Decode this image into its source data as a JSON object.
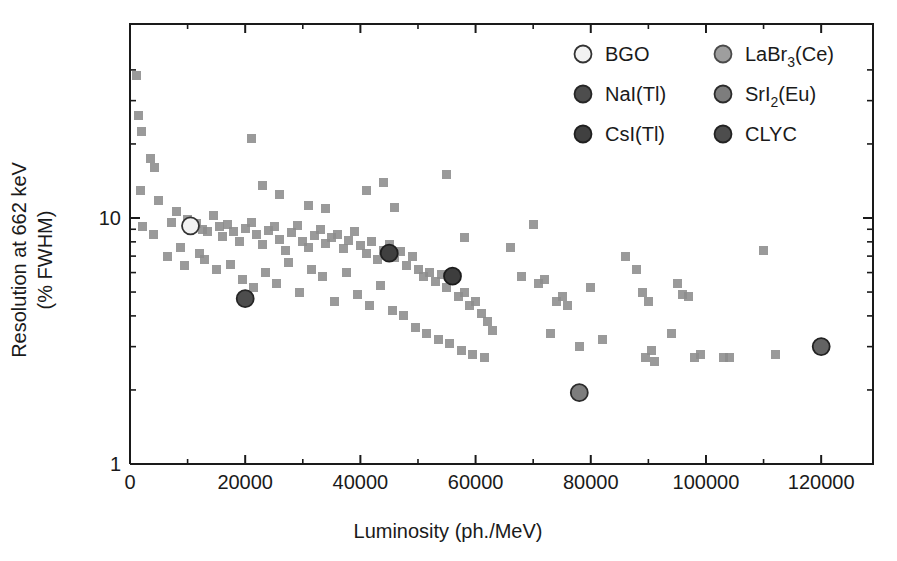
{
  "chart_data": {
    "type": "scatter",
    "title": "",
    "xlabel": "Luminosity (ph./MeV)",
    "ylabel_line1": "Resolution at 662 keV",
    "ylabel_line2": "(% FWHM)",
    "xlim": [
      0,
      129000
    ],
    "ylim": [
      1,
      45
    ],
    "yscale": "log",
    "xscale": "linear",
    "grid": false,
    "xticks": [
      0,
      20000,
      40000,
      60000,
      80000,
      100000,
      120000
    ],
    "xticklabels": [
      "0",
      "20000",
      "40000",
      "60000",
      "80000",
      "100000",
      "120000"
    ],
    "yticks": [
      1,
      10
    ],
    "yticklabels": [
      "1",
      "10"
    ],
    "legend_position": "top-right",
    "series": [
      {
        "name": "background scintillators",
        "marker": "square",
        "color": "#8c8c8c",
        "points": [
          [
            1200,
            38.0
          ],
          [
            1500,
            26.0
          ],
          [
            2000,
            22.5
          ],
          [
            1800,
            13.0
          ],
          [
            2200,
            9.2
          ],
          [
            3500,
            17.5
          ],
          [
            4200,
            16.0
          ],
          [
            5000,
            11.8
          ],
          [
            4000,
            8.6
          ],
          [
            6500,
            7.0
          ],
          [
            7200,
            9.6
          ],
          [
            8000,
            10.6
          ],
          [
            8800,
            7.6
          ],
          [
            10000,
            9.9
          ],
          [
            10500,
            9.3
          ],
          [
            11500,
            9.5
          ],
          [
            9500,
            6.4
          ],
          [
            12500,
            9.0
          ],
          [
            13500,
            8.8
          ],
          [
            12000,
            7.2
          ],
          [
            14500,
            10.2
          ],
          [
            15500,
            9.2
          ],
          [
            13000,
            6.8
          ],
          [
            16000,
            8.4
          ],
          [
            17000,
            9.4
          ],
          [
            15000,
            6.2
          ],
          [
            18000,
            8.8
          ],
          [
            19000,
            8.0
          ],
          [
            17500,
            6.5
          ],
          [
            20000,
            9.1
          ],
          [
            21000,
            9.6
          ],
          [
            19500,
            5.6
          ],
          [
            22000,
            8.6
          ],
          [
            23000,
            7.8
          ],
          [
            21500,
            5.2
          ],
          [
            24000,
            8.9
          ],
          [
            25000,
            9.2
          ],
          [
            23500,
            6.0
          ],
          [
            26000,
            8.2
          ],
          [
            27000,
            7.4
          ],
          [
            25500,
            5.4
          ],
          [
            28000,
            8.7
          ],
          [
            29000,
            9.3
          ],
          [
            27500,
            6.6
          ],
          [
            30000,
            8.0
          ],
          [
            31000,
            7.6
          ],
          [
            29500,
            5.0
          ],
          [
            32000,
            8.5
          ],
          [
            33000,
            9.0
          ],
          [
            31500,
            6.2
          ],
          [
            34000,
            7.9
          ],
          [
            35000,
            8.3
          ],
          [
            33500,
            5.8
          ],
          [
            36000,
            8.6
          ],
          [
            37000,
            7.5
          ],
          [
            35500,
            4.6
          ],
          [
            38000,
            8.1
          ],
          [
            39000,
            8.8
          ],
          [
            37500,
            6.0
          ],
          [
            40000,
            7.7
          ],
          [
            41000,
            7.2
          ],
          [
            39500,
            4.9
          ],
          [
            42000,
            8.0
          ],
          [
            43000,
            6.8
          ],
          [
            41500,
            4.4
          ],
          [
            44000,
            7.4
          ],
          [
            45000,
            7.8
          ],
          [
            43500,
            5.3
          ],
          [
            46000,
            6.9
          ],
          [
            47000,
            7.3
          ],
          [
            45500,
            4.2
          ],
          [
            48000,
            6.4
          ],
          [
            49000,
            7.0
          ],
          [
            47500,
            4.0
          ],
          [
            50000,
            6.2
          ],
          [
            51000,
            5.8
          ],
          [
            49500,
            3.6
          ],
          [
            52000,
            6.0
          ],
          [
            53000,
            5.5
          ],
          [
            51500,
            3.4
          ],
          [
            54000,
            5.9
          ],
          [
            55000,
            5.2
          ],
          [
            53500,
            3.2
          ],
          [
            56000,
            5.6
          ],
          [
            57000,
            4.8
          ],
          [
            55500,
            3.1
          ],
          [
            58000,
            5.0
          ],
          [
            59000,
            4.4
          ],
          [
            57500,
            2.9
          ],
          [
            60000,
            4.6
          ],
          [
            61000,
            4.1
          ],
          [
            59500,
            2.8
          ],
          [
            62000,
            3.8
          ],
          [
            63000,
            3.5
          ],
          [
            61500,
            2.7
          ],
          [
            21000,
            21.0
          ],
          [
            23000,
            13.5
          ],
          [
            26000,
            12.5
          ],
          [
            31000,
            11.2
          ],
          [
            34000,
            10.9
          ],
          [
            41000,
            13.0
          ],
          [
            44000,
            14.0
          ],
          [
            46000,
            11.0
          ],
          [
            55000,
            15.0
          ],
          [
            58000,
            8.3
          ],
          [
            66000,
            7.6
          ],
          [
            70000,
            9.4
          ],
          [
            68000,
            5.8
          ],
          [
            71000,
            5.4
          ],
          [
            72000,
            5.6
          ],
          [
            74000,
            4.6
          ],
          [
            75000,
            4.8
          ],
          [
            73000,
            3.4
          ],
          [
            76000,
            4.4
          ],
          [
            78000,
            3.0
          ],
          [
            80000,
            5.2
          ],
          [
            82000,
            3.2
          ],
          [
            86000,
            7.0
          ],
          [
            88000,
            6.2
          ],
          [
            89000,
            5.0
          ],
          [
            90000,
            4.6
          ],
          [
            90500,
            2.9
          ],
          [
            89500,
            2.7
          ],
          [
            91000,
            2.6
          ],
          [
            95000,
            5.4
          ],
          [
            96000,
            4.9
          ],
          [
            97000,
            4.8
          ],
          [
            94000,
            3.4
          ],
          [
            98000,
            2.7
          ],
          [
            99000,
            2.8
          ],
          [
            103000,
            2.7
          ],
          [
            104000,
            2.7
          ],
          [
            110000,
            7.4
          ],
          [
            112000,
            2.8
          ]
        ]
      }
    ],
    "highlighted": [
      {
        "label": "BGO",
        "x": 10500,
        "y": 9.3,
        "fill": "#f2f2f2",
        "stroke": "#333333"
      },
      {
        "label": "NaI(Tl)",
        "x": 20000,
        "y": 4.7,
        "fill": "#4d4d4d",
        "stroke": "#262626"
      },
      {
        "label": "CsI(Tl)",
        "x": 45000,
        "y": 7.2,
        "fill": "#404040",
        "stroke": "#1f1f1f"
      },
      {
        "label": "LaBr3(Ce)",
        "x": 56000,
        "y": 5.8,
        "fill": "#3d3d3d",
        "stroke": "#1c1c1c"
      },
      {
        "label": "SrI2(Eu)",
        "x": 78000,
        "y": 1.95,
        "fill": "#7d7d7d",
        "stroke": "#2b2b2b"
      },
      {
        "label": "CLYC",
        "x": 120000,
        "y": 3.0,
        "fill": "#636363",
        "stroke": "#222222"
      }
    ]
  },
  "legend": {
    "entries": [
      {
        "id": "bgo",
        "label": "BGO",
        "sub": "",
        "tail": "",
        "fill": "#f2f2f2",
        "stroke": "#333333",
        "col": 0,
        "row": 0
      },
      {
        "id": "nai",
        "label": "NaI(Tl)",
        "sub": "",
        "tail": "",
        "fill": "#4d4d4d",
        "stroke": "#262626",
        "col": 0,
        "row": 1
      },
      {
        "id": "csi",
        "label": "CsI(Tl)",
        "sub": "",
        "tail": "",
        "fill": "#404040",
        "stroke": "#1f1f1f",
        "col": 0,
        "row": 2
      },
      {
        "id": "labr3",
        "label": "LaBr",
        "sub": "3",
        "tail": "(Ce)",
        "fill": "#9e9e9e",
        "stroke": "#4a4a4a",
        "col": 1,
        "row": 0
      },
      {
        "id": "sri2",
        "label": "SrI",
        "sub": "2",
        "tail": "(Eu)",
        "fill": "#7d7d7d",
        "stroke": "#2b2b2b",
        "col": 1,
        "row": 1
      },
      {
        "id": "clyc",
        "label": "CLYC",
        "sub": "",
        "tail": "",
        "fill": "#4d4d4d",
        "stroke": "#222222",
        "col": 1,
        "row": 2
      }
    ]
  },
  "axes": {
    "x_title": "Luminosity (ph./MeV)",
    "y_title_top": "Resolution at 662 keV",
    "y_title_bottom": "(% FWHM)",
    "x_tick_labels": [
      "0",
      "20000",
      "40000",
      "60000",
      "80000",
      "100000",
      "120000"
    ],
    "y_tick_labels": [
      "10",
      "1"
    ]
  },
  "colors": {
    "data_gray": "#8c8c8c",
    "axis": "#1a1a1a",
    "background": "#ffffff"
  }
}
